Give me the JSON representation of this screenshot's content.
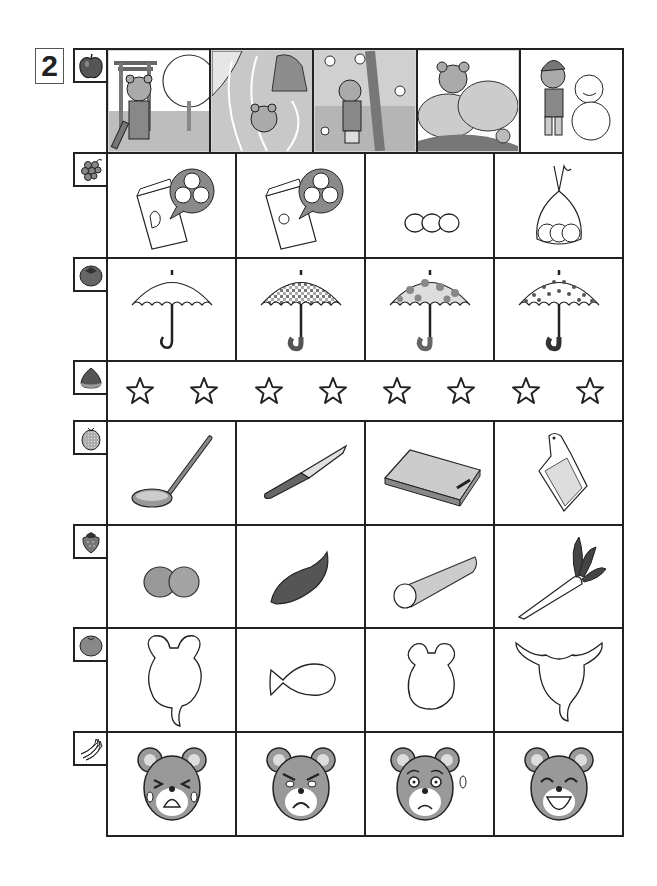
{
  "worksheet": {
    "question_number": "2",
    "accent_colors": {
      "line": "#222222",
      "fill_gray": "#8a8a8a",
      "light_gray": "#d6d6d6"
    }
  },
  "rows": [
    {
      "row_icon": "apple-icon",
      "type": "scenes",
      "cells": [
        {
          "name": "scene-shrine-new-year",
          "desc": "bear in hakama at torii gate with cherry tree"
        },
        {
          "name": "scene-river-swim",
          "desc": "bear swimming in river with petals"
        },
        {
          "name": "scene-cherry-blossom",
          "desc": "bear hugging cherry blossom tree"
        },
        {
          "name": "scene-hydrangea",
          "desc": "bear behind hydrangea flowers with snail"
        },
        {
          "name": "scene-snowman",
          "desc": "bear in winter hat building snowman"
        }
      ]
    },
    {
      "row_icon": "grapes-icon",
      "type": "pictures",
      "cells": [
        {
          "name": "bag-hen-eggs",
          "desc": "paper bag with hen and egg speech bubble"
        },
        {
          "name": "bag-chick-eggs",
          "desc": "paper bag with chick and egg speech bubble"
        },
        {
          "name": "three-eggs",
          "desc": "three eggs in a row"
        },
        {
          "name": "eggs-in-tied-bag",
          "desc": "three eggs in a tied plastic bag"
        }
      ]
    },
    {
      "row_icon": "persimmon-icon",
      "type": "pictures",
      "cells": [
        {
          "name": "umbrella-plain",
          "desc": "plain white umbrella"
        },
        {
          "name": "umbrella-checked",
          "desc": "gingham checked umbrella"
        },
        {
          "name": "umbrella-flowers",
          "desc": "flower patterned umbrella"
        },
        {
          "name": "umbrella-polka-dot",
          "desc": "polka dot umbrella"
        }
      ]
    },
    {
      "row_icon": "chestnut-icon",
      "type": "stars",
      "star_count": 8,
      "stars": [
        "☆",
        "☆",
        "☆",
        "☆",
        "☆",
        "☆",
        "☆",
        "☆"
      ]
    },
    {
      "row_icon": "melon-icon",
      "type": "pictures",
      "cells": [
        {
          "name": "ladle",
          "desc": "soup ladle"
        },
        {
          "name": "kitchen-knife",
          "desc": "kitchen knife"
        },
        {
          "name": "cutting-board",
          "desc": "cutting board"
        },
        {
          "name": "grater",
          "desc": "grater"
        }
      ]
    },
    {
      "row_icon": "strawberry-icon",
      "type": "pictures",
      "cells": [
        {
          "name": "potatoes",
          "desc": "two potatoes"
        },
        {
          "name": "sweet-potato",
          "desc": "sweet potato"
        },
        {
          "name": "burdock-root",
          "desc": "cut burdock / yam root"
        },
        {
          "name": "daikon-radish",
          "desc": "daikon radish with leaves"
        }
      ]
    },
    {
      "row_icon": "tangerine-icon",
      "type": "pictures",
      "cells": [
        {
          "name": "mouse-head-bubble",
          "desc": "mouse-head shaped speech bubble outline"
        },
        {
          "name": "fish-outline",
          "desc": "fish shaped outline"
        },
        {
          "name": "bear-head-outline",
          "desc": "bear head shaped outline"
        },
        {
          "name": "deer-head-bubble",
          "desc": "deer/cow head shaped speech bubble outline"
        }
      ]
    },
    {
      "row_icon": "banana-icon",
      "type": "pictures",
      "cells": [
        {
          "name": "bear-crying",
          "desc": "bear face crying"
        },
        {
          "name": "bear-angry",
          "desc": "bear face angry"
        },
        {
          "name": "bear-worried",
          "desc": "bear face worried / nervous"
        },
        {
          "name": "bear-laughing",
          "desc": "bear face laughing"
        }
      ]
    }
  ]
}
